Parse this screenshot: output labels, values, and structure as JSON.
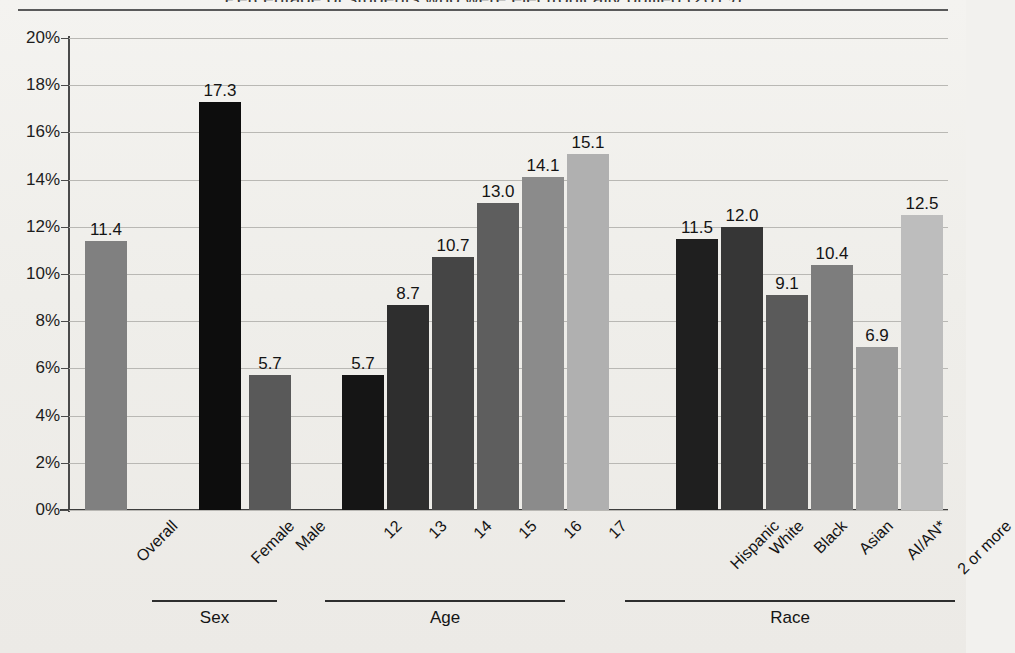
{
  "page": {
    "title_cut_off": "Percentage of students who were electronically bullied (2019)"
  },
  "chart_data": {
    "type": "bar",
    "title": "",
    "xlabel": "",
    "ylabel": "",
    "ylim": [
      0,
      20
    ],
    "grid": true,
    "legend": "none",
    "ytick_labels": [
      "20%",
      "18%",
      "16%",
      "14%",
      "12%",
      "10%",
      "8%",
      "6%",
      "4%",
      "2%",
      "0%"
    ],
    "ytick_values": [
      20,
      18,
      16,
      14,
      12,
      10,
      8,
      6,
      4,
      2,
      0
    ],
    "categories": [
      "Overall",
      "Female",
      "Male",
      "12",
      "13",
      "14",
      "15",
      "16",
      "17",
      "Hispanic",
      "White",
      "Black",
      "Asian",
      "AI/AN*",
      "2 or more"
    ],
    "values": [
      11.4,
      17.3,
      5.7,
      5.7,
      8.7,
      10.7,
      13.0,
      14.1,
      15.1,
      11.5,
      12.0,
      9.1,
      10.4,
      6.9,
      12.5
    ],
    "value_labels": [
      "11.4",
      "17.3",
      "5.7",
      "5.7",
      "8.7",
      "10.7",
      "13.0",
      "14.1",
      "15.1",
      "11.5",
      "12.0",
      "9.1",
      "10.4",
      "6.9",
      "12.5"
    ],
    "bar_colors": [
      "#808080",
      "#0d0d0d",
      "#595959",
      "#151515",
      "#2e2e2e",
      "#454545",
      "#5e5e5e",
      "#8b8b8b",
      "#b0b0b0",
      "#1f1f1f",
      "#363636",
      "#5a5a5a",
      "#7d7d7d",
      "#9a9a9a",
      "#bdbdbd"
    ],
    "groups": [
      {
        "name": "Sex",
        "categories": [
          "Female",
          "Male"
        ]
      },
      {
        "name": "Age",
        "categories": [
          "12",
          "13",
          "14",
          "15",
          "16",
          "17"
        ]
      },
      {
        "name": "Race",
        "categories": [
          "Hispanic",
          "White",
          "Black",
          "Asian",
          "AI/AN*",
          "2 or more"
        ]
      }
    ]
  },
  "bars": [
    {
      "label": "Overall",
      "value_label": "11.4",
      "value": 11.4,
      "color": "#808080",
      "left": 17,
      "width": 42
    },
    {
      "label": "Female",
      "value_label": "17.3",
      "value": 17.3,
      "color": "#0d0d0d",
      "left": 131,
      "width": 42
    },
    {
      "label": "Male",
      "value_label": "5.7",
      "value": 5.7,
      "color": "#595959",
      "left": 181,
      "width": 42
    },
    {
      "label": "12",
      "value_label": "5.7",
      "value": 5.7,
      "color": "#151515",
      "left": 274,
      "width": 42
    },
    {
      "label": "13",
      "value_label": "8.7",
      "value": 8.7,
      "color": "#2e2e2e",
      "left": 319,
      "width": 42
    },
    {
      "label": "14",
      "value_label": "10.7",
      "value": 10.7,
      "color": "#454545",
      "left": 364,
      "width": 42
    },
    {
      "label": "15",
      "value_label": "13.0",
      "value": 13.0,
      "color": "#5e5e5e",
      "left": 409,
      "width": 42
    },
    {
      "label": "16",
      "value_label": "14.1",
      "value": 14.1,
      "color": "#8b8b8b",
      "left": 454,
      "width": 42
    },
    {
      "label": "17",
      "value_label": "15.1",
      "value": 15.1,
      "color": "#b0b0b0",
      "left": 499,
      "width": 42
    },
    {
      "label": "Hispanic",
      "value_label": "11.5",
      "value": 11.5,
      "color": "#1f1f1f",
      "left": 608,
      "width": 42
    },
    {
      "label": "White",
      "value_label": "12.0",
      "value": 12.0,
      "color": "#363636",
      "left": 653,
      "width": 42
    },
    {
      "label": "Black",
      "value_label": "9.1",
      "value": 9.1,
      "color": "#5a5a5a",
      "left": 698,
      "width": 42
    },
    {
      "label": "Asian",
      "value_label": "10.4",
      "value": 10.4,
      "color": "#7d7d7d",
      "left": 743,
      "width": 42
    },
    {
      "label": "AI/AN*",
      "value_label": "6.9",
      "value": 6.9,
      "color": "#9a9a9a",
      "left": 788,
      "width": 42
    },
    {
      "label": "2 or more",
      "value_label": "12.5",
      "value": 12.5,
      "color": "#bdbdbd",
      "left": 833,
      "width": 42
    }
  ],
  "group_bands": [
    {
      "name": "Sex",
      "left": 152,
      "width": 125
    },
    {
      "name": "Age",
      "left": 325,
      "width": 240
    },
    {
      "name": "Race",
      "left": 625,
      "width": 330
    }
  ],
  "colors": {
    "background": "#f2f1ee",
    "axis": "#3d3d3d",
    "gridline": "#b9b8b4",
    "text": "#141414"
  }
}
